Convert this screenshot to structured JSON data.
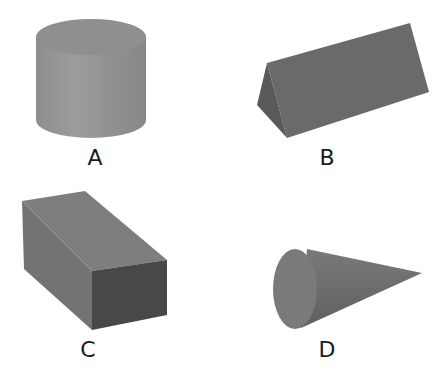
{
  "figure": {
    "shapes": [
      {
        "id": "A",
        "label": "A",
        "type": "cylinder"
      },
      {
        "id": "B",
        "label": "B",
        "type": "triangular-prism"
      },
      {
        "id": "C",
        "label": "C",
        "type": "rectangular-prism"
      },
      {
        "id": "D",
        "label": "D",
        "type": "cone"
      }
    ]
  },
  "colors": {
    "background": "#ffffff",
    "face_light": "#9a9a9a",
    "face_mid": "#7d7d7d",
    "face_dark": "#4a4a4a",
    "label": "#1a1a1a"
  }
}
